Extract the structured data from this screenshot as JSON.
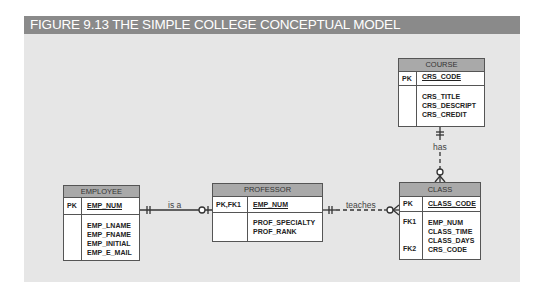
{
  "figure": {
    "title": "FIGURE 9.13  THE SIMPLE COLLEGE CONCEPTUAL MODEL"
  },
  "entities": {
    "course": {
      "name": "COURSE",
      "pk_label": "PK",
      "pk": "CRS_CODE",
      "attributes": [
        "CRS_TITLE",
        "CRS_DESCRIPT",
        "CRS_CREDIT"
      ]
    },
    "employee": {
      "name": "EMPLOYEE",
      "pk_label": "PK",
      "pk": "EMP_NUM",
      "attributes": [
        "EMP_LNAME",
        "EMP_FNAME",
        "EMP_INITIAL",
        "EMP_E_MAIL"
      ]
    },
    "professor": {
      "name": "PROFESSOR",
      "pk_label": "PK,FK1",
      "pk": "EMP_NUM",
      "attributes": [
        "PROF_SPECIALTY",
        "PROF_RANK"
      ]
    },
    "class": {
      "name": "CLASS",
      "pk_label": "PK",
      "pk": "CLASS_CODE",
      "attributes": [
        "EMP_NUM",
        "CLASS_TIME",
        "CLASS_DAYS",
        "CRS_CODE"
      ],
      "fk_labels": [
        "FK1",
        "FK2"
      ]
    }
  },
  "relationships": [
    {
      "label": "is a",
      "from": "EMPLOYEE",
      "to": "PROFESSOR",
      "style": "solid",
      "from_card": "mandatory-one",
      "to_card": "optional-one"
    },
    {
      "label": "teaches",
      "from": "PROFESSOR",
      "to": "CLASS",
      "style": "dashed",
      "from_card": "mandatory-one",
      "to_card": "optional-many"
    },
    {
      "label": "has",
      "from": "COURSE",
      "to": "CLASS",
      "style": "dashed",
      "from_card": "mandatory-one",
      "to_card": "optional-many"
    }
  ],
  "colors": {
    "title_bar": "#8a8a8a",
    "panel": "#e6e6e6",
    "entity_header": "#a9a9a9",
    "line": "#333333"
  }
}
